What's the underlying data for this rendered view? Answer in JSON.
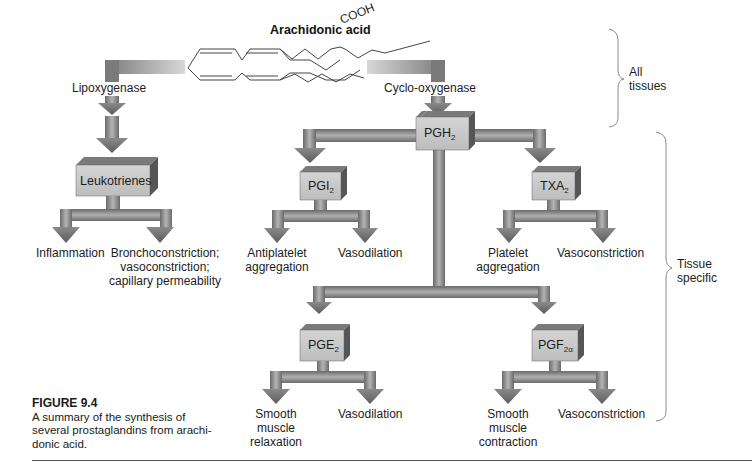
{
  "figure": {
    "number_label": "FIGURE 9.4",
    "caption_line1": "A summary of the synthesis of",
    "caption_line2": "several prostaglandins from arachi-",
    "caption_line3": "donic acid."
  },
  "substrate": {
    "name": "Arachidonic acid",
    "group": "COOH"
  },
  "enzymes": {
    "left": "Lipoxygenase",
    "right": "Cyclo-oxygenase"
  },
  "nodes": {
    "leukotrienes": {
      "label": "Leukotrienes"
    },
    "pgh2": {
      "base": "PGH",
      "sub": "2"
    },
    "pgi2": {
      "base": "PGI",
      "sub": "2"
    },
    "txa2": {
      "base": "TXA",
      "sub": "2"
    },
    "pge2": {
      "base": "PGE",
      "sub": "2"
    },
    "pgf2a": {
      "base": "PGF",
      "sub": "2α"
    }
  },
  "effects": {
    "leukotrienes": {
      "left": [
        "Inflammation"
      ],
      "right": [
        "Bronchoconstriction;",
        "vasoconstriction;",
        "capillary permeability"
      ]
    },
    "pgi2": {
      "left": [
        "Antiplatelet",
        "aggregation"
      ],
      "right": [
        "Vasodilation"
      ]
    },
    "txa2": {
      "left": [
        "Platelet",
        "aggregation"
      ],
      "right": [
        "Vasoconstriction"
      ]
    },
    "pge2": {
      "left": [
        "Smooth",
        "muscle",
        "relaxation"
      ],
      "right": [
        "Vasodilation"
      ]
    },
    "pgf2a": {
      "left": [
        "Smooth",
        "muscle",
        "contraction"
      ],
      "right": [
        "Vasoconstriction"
      ]
    }
  },
  "brackets": {
    "top": [
      "All",
      "tissues"
    ],
    "bottom": [
      "Tissue",
      "specific"
    ]
  },
  "colors": {
    "arrow_dark": "#6e6e6e",
    "arrow_light": "#c8c8c8",
    "box_face": "#c9c9c9",
    "box_side": "#5a5a5a",
    "box_top": "#7a7a7a",
    "bracket": "#888888"
  }
}
